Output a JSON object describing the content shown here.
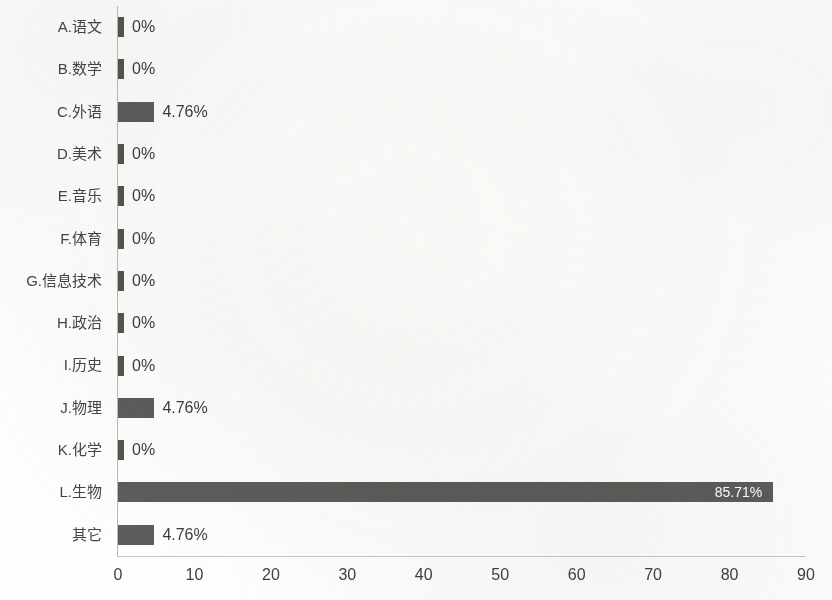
{
  "chart_data": {
    "type": "bar",
    "orientation": "horizontal",
    "title": "",
    "subtitle": "",
    "xlabel": "",
    "ylabel": "",
    "xlim": [
      0,
      90
    ],
    "xticks": [
      "0",
      "10",
      "20",
      "30",
      "40",
      "50",
      "60",
      "70",
      "80",
      "90"
    ],
    "xtick_values": [
      0,
      10,
      20,
      30,
      40,
      50,
      60,
      70,
      80,
      90
    ],
    "grid": false,
    "legend": "none",
    "bar_color": "#5c5c5a",
    "inside_label_color": "#ffffff",
    "categories": [
      "A.语文",
      "B.数学",
      "C.外语",
      "D.美术",
      "E.音乐",
      "F.体育",
      "G.信息技术",
      "H.政治",
      "I.历史",
      "J.物理",
      "K.化学",
      "L.生物",
      "其它"
    ],
    "values": [
      0,
      0,
      4.76,
      0,
      0,
      0,
      0,
      0,
      0,
      4.76,
      0,
      85.71,
      4.76
    ],
    "data_labels": [
      "0%",
      "0%",
      "4.76%",
      "0%",
      "0%",
      "0%",
      "0%",
      "0%",
      "0%",
      "4.76%",
      "0%",
      "85.71%",
      "4.76%"
    ],
    "label_placement": [
      "outside",
      "outside",
      "outside",
      "outside",
      "outside",
      "outside",
      "outside",
      "outside",
      "outside",
      "outside",
      "outside",
      "inside",
      "outside"
    ]
  }
}
